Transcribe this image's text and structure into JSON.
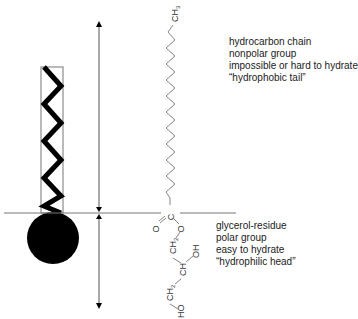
{
  "tail_description": {
    "lines": [
      "hydrocarbon chain",
      "nonpolar group",
      "impossible or hard to hydrate",
      "“hydrophobic tail”"
    ]
  },
  "head_description": {
    "lines": [
      "glycerol-residue",
      "polar group",
      "easy to hydrate",
      "“hydrophilic head”"
    ]
  },
  "molecule": {
    "terminal_group": "CH3",
    "carbonyl_carbon": "C",
    "carbonyl_oxygen": "O",
    "ester_oxygen": "O",
    "glycerol": [
      "CH2",
      "CH",
      "OH",
      "CH2",
      "HO"
    ]
  },
  "colors": {
    "line": "#555555",
    "fill": "#000000",
    "text": "#222222"
  }
}
